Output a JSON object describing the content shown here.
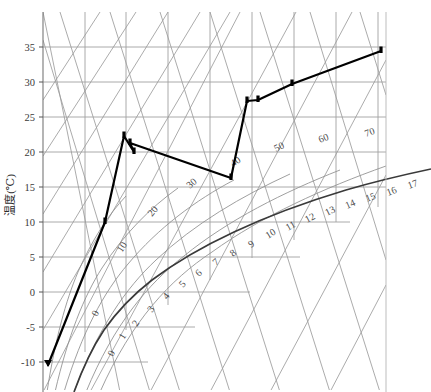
{
  "figure": {
    "kind": "psychrometric-chart",
    "background": "#ffffff",
    "frame_color": "#8a8a8a",
    "grid_color": "#9a9a9a",
    "saturation_color": "#3a3a3a",
    "series_color": "#000000"
  },
  "axes": {
    "y_title": "温度(℃)",
    "y_ticks": [
      "35",
      "30",
      "25",
      "20",
      "15",
      "10",
      "5",
      "0",
      "-5",
      "-10"
    ],
    "y_values": [
      35,
      30,
      25,
      20,
      15,
      10,
      5,
      0,
      -5,
      -10
    ],
    "y_min": -10,
    "y_max": 35,
    "y_unit": "℃"
  },
  "rh_labels": [
    "0",
    "10",
    "20",
    "30",
    "40",
    "50",
    "60",
    "70"
  ],
  "humidity_ratio_labels": [
    "0",
    "1",
    "2",
    "3",
    "4",
    "5",
    "6",
    "7",
    "8",
    "9",
    "10",
    "11",
    "12",
    "13",
    "14",
    "15",
    "16",
    "17"
  ],
  "chart_data": {
    "type": "line",
    "title": "",
    "xlabel": "",
    "ylabel": "温度(℃)",
    "ylim": [
      -10,
      35
    ],
    "grid": true,
    "legend": "none",
    "relative_humidity_curves": [
      0,
      10,
      20,
      30,
      40,
      50,
      60,
      70
    ],
    "humidity_ratio_ticks": [
      0,
      1,
      2,
      3,
      4,
      5,
      6,
      7,
      8,
      9,
      10,
      11,
      12,
      13,
      14,
      15,
      16,
      17
    ],
    "series": [
      {
        "name": "process-path",
        "marker": "triangle-and-bars",
        "points_temperature": [
          -9.8,
          10.0,
          22.7,
          20.3,
          21.5,
          16.5,
          26.5,
          26.8,
          29.5,
          34.4
        ],
        "points_humidity_ratio": [
          0.3,
          2.2,
          3.6,
          3.8,
          3.7,
          8.8,
          9.3,
          9.8,
          11.4,
          15.6
        ],
        "vertex_pixels": [
          [
            48,
            365
          ],
          [
            105,
            222
          ],
          [
            124,
            136
          ],
          [
            134,
            152
          ],
          [
            130,
            143
          ],
          [
            231,
            178
          ],
          [
            247,
            101
          ],
          [
            258,
            100
          ],
          [
            292,
            84
          ],
          [
            381,
            51
          ]
        ]
      }
    ]
  },
  "annotations": {
    "rh_curve_positions": [
      {
        "label": "0",
        "x": 97,
        "y": 317,
        "rot": -62
      },
      {
        "label": "10",
        "x": 122,
        "y": 253,
        "rot": -58
      },
      {
        "label": "20",
        "x": 152,
        "y": 217,
        "rot": -50
      },
      {
        "label": "30",
        "x": 190,
        "y": 189,
        "rot": -42
      },
      {
        "label": "40",
        "x": 233,
        "y": 167,
        "rot": -33
      },
      {
        "label": "50",
        "x": 276,
        "y": 152,
        "rot": -26
      },
      {
        "label": "60",
        "x": 320,
        "y": 143,
        "rot": -22
      },
      {
        "label": "70",
        "x": 366,
        "y": 137,
        "rot": -20
      }
    ],
    "w_tick_positions": [
      {
        "label": "0",
        "x": 113,
        "y": 357,
        "rot": -62
      },
      {
        "label": "1",
        "x": 124,
        "y": 340,
        "rot": -60
      },
      {
        "label": "2",
        "x": 137,
        "y": 327,
        "rot": -57
      },
      {
        "label": "3",
        "x": 152,
        "y": 313,
        "rot": -54
      },
      {
        "label": "4",
        "x": 167,
        "y": 300,
        "rot": -50
      },
      {
        "label": "5",
        "x": 183,
        "y": 288,
        "rot": -47
      },
      {
        "label": "6",
        "x": 199,
        "y": 277,
        "rot": -44
      },
      {
        "label": "7",
        "x": 216,
        "y": 266,
        "rot": -41
      },
      {
        "label": "8",
        "x": 233,
        "y": 257,
        "rot": -38
      },
      {
        "label": "9",
        "x": 251,
        "y": 248,
        "rot": -35
      },
      {
        "label": "10",
        "x": 268,
        "y": 239,
        "rot": -32
      },
      {
        "label": "11",
        "x": 288,
        "y": 231,
        "rot": -30
      },
      {
        "label": "12",
        "x": 307,
        "y": 223,
        "rot": -28
      },
      {
        "label": "13",
        "x": 327,
        "y": 216,
        "rot": -26
      },
      {
        "label": "14",
        "x": 347,
        "y": 209,
        "rot": -24
      },
      {
        "label": "15",
        "x": 367,
        "y": 202,
        "rot": -22
      },
      {
        "label": "16",
        "x": 388,
        "y": 196,
        "rot": -21
      },
      {
        "label": "17",
        "x": 409,
        "y": 189,
        "rot": -20
      }
    ]
  }
}
